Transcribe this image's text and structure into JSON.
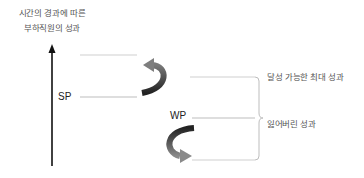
{
  "diagram": {
    "title_lines": [
      "시간의 경과에 따른",
      "부하직원의 성과"
    ],
    "labels": {
      "sp": "SP",
      "wp": "WP"
    },
    "annotations": {
      "max_performance": "달성 가능한 최대 성과",
      "lost_performance": "잃어버린 성과"
    },
    "icons": {
      "vertical_axis": "up-arrow-icon",
      "top_curve": "curved-arrow-up-icon",
      "bottom_curve": "curved-arrow-down-icon",
      "brace": "right-curly-brace-icon"
    },
    "colors": {
      "axis": "#111111",
      "lines": "#c8c8c8",
      "arrow_dark": "#2a2a2a",
      "arrow_mid": "#666666",
      "arrow_light": "#8a8a8a",
      "text": "#555555"
    }
  }
}
